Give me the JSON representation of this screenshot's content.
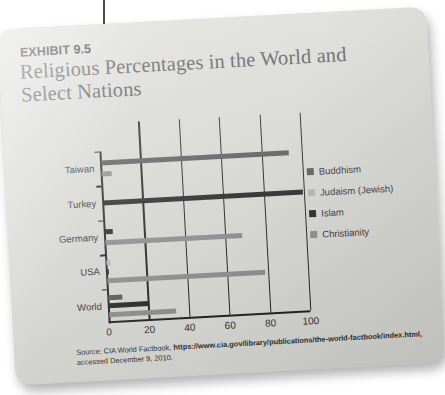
{
  "exhibit": {
    "label": "EXHIBIT 9.5",
    "title": "Religious Percentages in the World and Select Nations"
  },
  "source": {
    "prefix": "Source: CIA World Factbook, ",
    "url_part1": "https://www.cia.gov/library/publications/the-world-factbook/",
    "url_part2": "index.html,",
    "suffix": " accessed December 9, 2010."
  },
  "legend": {
    "items": [
      {
        "label": "Buddhism",
        "color": "#545454"
      },
      {
        "label": "Judaism (Jewish)",
        "color": "#b4b4b4"
      },
      {
        "label": "Islam",
        "color": "#1f1f1f"
      },
      {
        "label": "Christianity",
        "color": "#8a8a8a"
      }
    ]
  },
  "chart_data": {
    "type": "bar",
    "orientation": "horizontal",
    "title": "Religious Percentages in the World and Select Nations",
    "xlabel": "",
    "ylabel": "",
    "xlim": [
      0,
      100
    ],
    "xticks": [
      "0",
      "20",
      "40",
      "60",
      "80",
      "100"
    ],
    "grid": true,
    "legend_position": "right",
    "categories": [
      "Taiwan",
      "Turkey",
      "Germany",
      "USA",
      "World"
    ],
    "series": [
      {
        "name": "Buddhism",
        "color": "#545454",
        "values": [
          93,
          0,
          0,
          0,
          7
        ]
      },
      {
        "name": "Judaism (Jewish)",
        "color": "#b4b4b4",
        "values": [
          0,
          0,
          0,
          2,
          0
        ]
      },
      {
        "name": "Islam",
        "color": "#1f1f1f",
        "values": [
          0,
          99,
          4,
          1,
          20
        ]
      },
      {
        "name": "Christianity",
        "color": "#8a8a8a",
        "values": [
          5,
          0,
          68,
          78,
          33
        ]
      }
    ]
  }
}
